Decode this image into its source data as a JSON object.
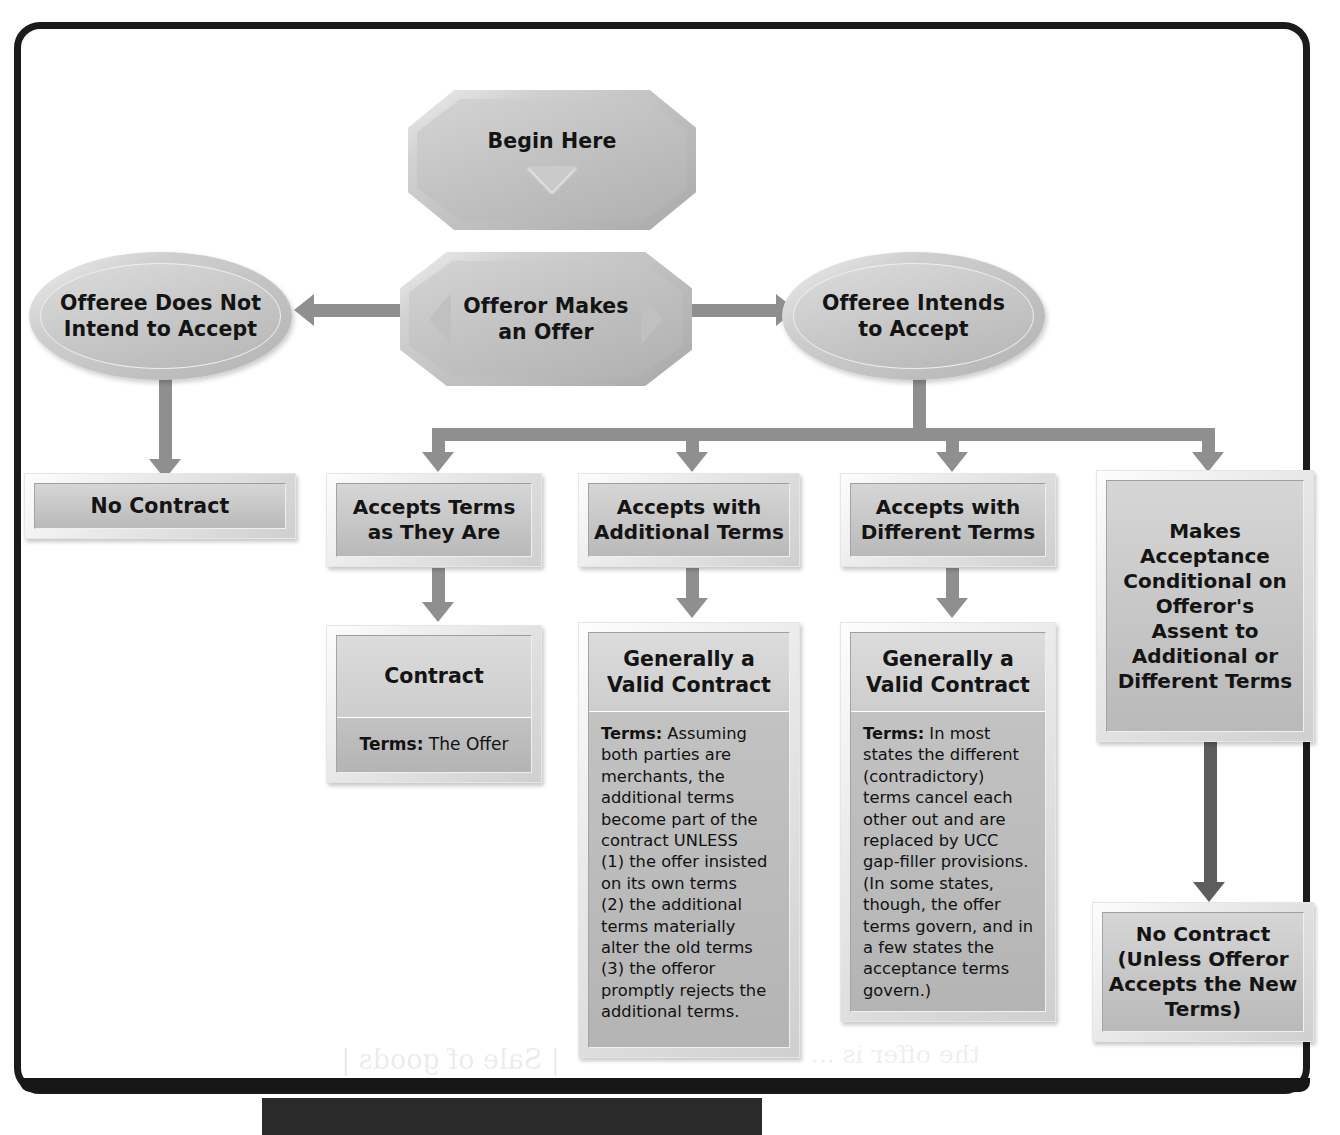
{
  "diagram": {
    "accent_gray": "#8f8f8f",
    "node_face": "#c6c6c6",
    "frame_color": "#1b1b1b",
    "ghost_text_a": "| Sale of goods |",
    "ghost_text_b": "the offer is ..."
  },
  "nodes": {
    "begin": {
      "label": "Begin Here",
      "shape": "octagon",
      "glyph": "triangle-down"
    },
    "offer": {
      "label_line1": "Offeror Makes",
      "label_line2": "an Offer",
      "shape": "octagon",
      "glyph_left": "triangle-left",
      "glyph_right": "triangle-right"
    },
    "not_intend": {
      "label_line1": "Offeree Does Not",
      "label_line2": "Intend to Accept",
      "shape": "ellipse"
    },
    "intends": {
      "label_line1": "Offeree Intends",
      "label_line2": "to Accept",
      "shape": "ellipse"
    },
    "no_contract_left": {
      "label": "No Contract",
      "shape": "rect"
    },
    "accepts_as_is": {
      "label_line1": "Accepts Terms",
      "label_line2": "as They Are",
      "shape": "rect"
    },
    "accepts_additional": {
      "label_line1": "Accepts with",
      "label_line2": "Additional Terms",
      "shape": "rect"
    },
    "accepts_different": {
      "label_line1": "Accepts with",
      "label_line2": "Different Terms",
      "shape": "rect"
    },
    "conditional": {
      "label": "Makes\nAcceptance\nConditional on\nOfferor's\nAssent to\nAdditional or\nDifferent Terms",
      "shape": "rect"
    },
    "contract": {
      "title": "Contract",
      "terms_label": "Terms:",
      "terms_body": " The Offer",
      "shape": "split-rect"
    },
    "valid_additional": {
      "title_line1": "Generally a",
      "title_line2": "Valid Contract",
      "terms_label": "Terms:",
      "terms_body": " Assuming both parties are merchants, the additional terms become part of the contract UNLESS\n(1) the offer insisted on its own terms\n(2) the additional terms materially alter the old terms\n(3) the offeror promptly rejects the additional terms.",
      "shape": "split-rect"
    },
    "valid_different": {
      "title_line1": "Generally a",
      "title_line2": "Valid Contract",
      "terms_label": "Terms:",
      "terms_body": " In most states the different (contradictory) terms cancel each other out and are replaced by UCC gap-filler provisions. (In some states, though, the offer terms govern, and in a few states the acceptance terms govern.)",
      "shape": "split-rect"
    },
    "no_contract_right": {
      "label_line1": "No Contract",
      "label_line2": "(Unless Offeror",
      "label_line3": "Accepts the New",
      "label_line4": "Terms)",
      "shape": "rect"
    }
  },
  "edges": [
    {
      "from": "begin",
      "to": "offer",
      "style": "implicit-vertical"
    },
    {
      "from": "offer",
      "to": "not_intend",
      "style": "arrow-left"
    },
    {
      "from": "offer",
      "to": "intends",
      "style": "arrow-right"
    },
    {
      "from": "not_intend",
      "to": "no_contract_left",
      "style": "arrow-down"
    },
    {
      "from": "intends",
      "to": "accepts_as_is",
      "style": "bus-down"
    },
    {
      "from": "intends",
      "to": "accepts_additional",
      "style": "bus-down"
    },
    {
      "from": "intends",
      "to": "accepts_different",
      "style": "bus-down"
    },
    {
      "from": "intends",
      "to": "conditional",
      "style": "bus-down"
    },
    {
      "from": "accepts_as_is",
      "to": "contract",
      "style": "arrow-down"
    },
    {
      "from": "accepts_additional",
      "to": "valid_additional",
      "style": "arrow-down"
    },
    {
      "from": "accepts_different",
      "to": "valid_different",
      "style": "arrow-down"
    },
    {
      "from": "conditional",
      "to": "no_contract_right",
      "style": "arrow-down"
    }
  ]
}
